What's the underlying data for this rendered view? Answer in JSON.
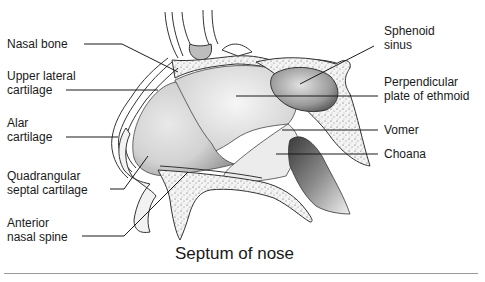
{
  "title": "Septum of nose",
  "labels_left": [
    {
      "id": "nasal-bone",
      "text": "Nasal bone"
    },
    {
      "id": "upper-lateral-cartilage",
      "text": "Upper lateral\ncartilage"
    },
    {
      "id": "alar-cartilage",
      "text": "Alar\ncartilage"
    },
    {
      "id": "quadrangular-septal-cartilage",
      "text": "Quadrangular\nseptal cartilage"
    },
    {
      "id": "anterior-nasal-spine",
      "text": "Anterior\nnasal spine"
    }
  ],
  "labels_right": [
    {
      "id": "sphenoid-sinus",
      "text": "Sphenoid\nsinus"
    },
    {
      "id": "perpendicular-plate",
      "text": "Perpendicular\nplate of ethmoid"
    },
    {
      "id": "vomer",
      "text": "Vomer"
    },
    {
      "id": "choana",
      "text": "Choana"
    }
  ]
}
